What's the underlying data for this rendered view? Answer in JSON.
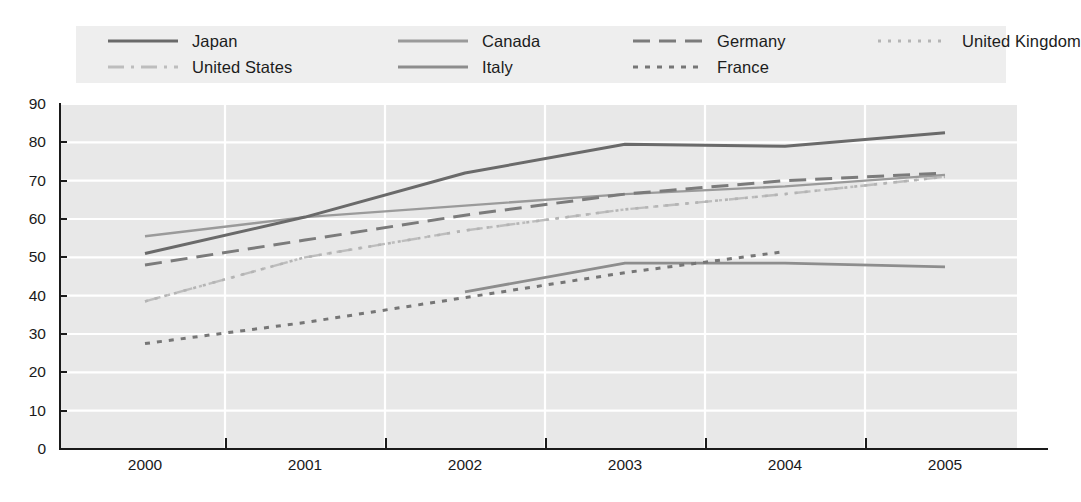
{
  "chart_data": {
    "type": "line",
    "title": "",
    "subtitle": "",
    "xlabel": "",
    "ylabel": "",
    "x": [
      "2000",
      "2001",
      "2002",
      "2003",
      "2004",
      "2005"
    ],
    "xlim": [
      "2000",
      "2005"
    ],
    "ylim": [
      0,
      90
    ],
    "yticks": [
      0,
      10,
      20,
      30,
      40,
      50,
      60,
      70,
      80,
      90
    ],
    "grid": true,
    "grid_orientation": "both",
    "legend_position": "top",
    "series": [
      {
        "name": "Japan",
        "style": "solid",
        "color": "#6a6a6a",
        "width": 3,
        "x": [
          "2000",
          "2001",
          "2002",
          "2003",
          "2004",
          "2005"
        ],
        "values": [
          51,
          60.5,
          72,
          79.5,
          79,
          82.5
        ]
      },
      {
        "name": "Canada",
        "style": "solid",
        "color": "#9a9a9a",
        "width": 2.4,
        "x": [
          "2000",
          "2001",
          "2002",
          "2003",
          "2004",
          "2005"
        ],
        "values": [
          55.5,
          60.5,
          63.5,
          66.5,
          68.5,
          71.5
        ]
      },
      {
        "name": "Germany",
        "style": "dashed",
        "color": "#7b7b7b",
        "width": 3,
        "x": [
          "2000",
          "2001",
          "2002",
          "2003",
          "2004",
          "2005"
        ],
        "values": [
          48,
          54.5,
          61,
          66.5,
          70,
          72
        ]
      },
      {
        "name": "United Kingdom",
        "style": "fine-dotted",
        "color": "#b4b4b4",
        "width": 2.6,
        "x": [
          "2000",
          "2001",
          "2002",
          "2003",
          "2004",
          "2005"
        ],
        "values": [
          38.5,
          50,
          57,
          62.5,
          66.5,
          71
        ]
      },
      {
        "name": "United States",
        "style": "dash-dot",
        "color": "#bdbdbd",
        "width": 2.4,
        "x": [
          "2000",
          "2001",
          "2002",
          "2003",
          "2004",
          "2005"
        ],
        "values": [
          38.5,
          50,
          57,
          62.5,
          66.5,
          71
        ]
      },
      {
        "name": "Italy",
        "style": "solid",
        "color": "#8d8d8d",
        "width": 2.8,
        "x": [
          "2002",
          "2003",
          "2004",
          "2005"
        ],
        "values": [
          41,
          48.5,
          48.5,
          47.5
        ]
      },
      {
        "name": "France",
        "style": "dotted",
        "color": "#767676",
        "width": 3,
        "x": [
          "2000",
          "2001",
          "2002",
          "2003",
          "2004"
        ],
        "values": [
          27.5,
          33,
          39.5,
          46,
          51.5
        ]
      }
    ]
  },
  "legend": {
    "rows": [
      [
        {
          "label": "Japan",
          "series": "Japan"
        },
        {
          "label": "Canada",
          "series": "Canada"
        },
        {
          "label": "Germany",
          "series": "Germany"
        },
        {
          "label": "United Kingdom",
          "series": "United Kingdom"
        }
      ],
      [
        {
          "label": "United States",
          "series": "United States"
        },
        {
          "label": "Italy",
          "series": "Italy"
        },
        {
          "label": "France",
          "series": "France"
        }
      ]
    ]
  },
  "colors": {
    "plot_background": "#e8e8e8",
    "legend_background": "#eeeeee",
    "gridline": "#ffffff",
    "axis": "#1a1a1a",
    "page_background": "#ffffff"
  }
}
